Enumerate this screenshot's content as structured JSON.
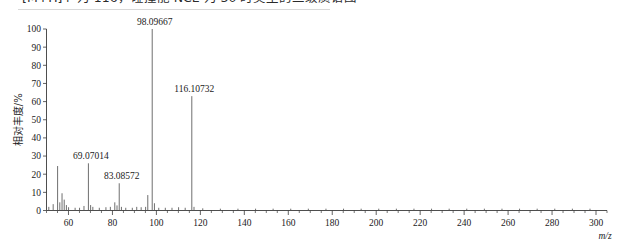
{
  "caption": {
    "text": "[M+H]+ 为 116，碰撞能 NCE 为 30 时类型的二级质谱图"
  },
  "chart_data": {
    "type": "bar",
    "title": "",
    "subtitle": "",
    "xlabel": "m/z",
    "ylabel": "相对丰度/%",
    "xlim": [
      50,
      305
    ],
    "ylim": [
      0,
      100
    ],
    "grid": false,
    "legend": "none",
    "x_ticks": [
      60,
      80,
      100,
      120,
      140,
      160,
      180,
      200,
      220,
      240,
      260,
      280,
      300
    ],
    "x_tick_labels": [
      "60",
      "80",
      "100",
      "120",
      "140",
      "160",
      "180",
      "200",
      "220",
      "240",
      "260",
      "280",
      "300"
    ],
    "x_minor_step": 5,
    "y_ticks": [
      0,
      10,
      20,
      30,
      40,
      50,
      60,
      70,
      80,
      90,
      100
    ],
    "y_tick_labels": [
      "0",
      "10",
      "20",
      "30",
      "40",
      "50",
      "60",
      "70",
      "80",
      "90",
      "100"
    ],
    "peaks": [
      {
        "mz": 51.05,
        "intensity": 2.0,
        "label": ""
      },
      {
        "mz": 53.04,
        "intensity": 3.5,
        "label": ""
      },
      {
        "mz": 55.05,
        "intensity": 24.5,
        "label": ""
      },
      {
        "mz": 56.05,
        "intensity": 4.5,
        "label": ""
      },
      {
        "mz": 57.07,
        "intensity": 9.5,
        "label": ""
      },
      {
        "mz": 58.06,
        "intensity": 6.0,
        "label": ""
      },
      {
        "mz": 59.05,
        "intensity": 3.0,
        "label": ""
      },
      {
        "mz": 60.04,
        "intensity": 1.8,
        "label": ""
      },
      {
        "mz": 63.02,
        "intensity": 1.5,
        "label": ""
      },
      {
        "mz": 65.04,
        "intensity": 1.5,
        "label": ""
      },
      {
        "mz": 67.05,
        "intensity": 2.5,
        "label": ""
      },
      {
        "mz": 69.07014,
        "intensity": 26.0,
        "label": "69.07014"
      },
      {
        "mz": 70.07,
        "intensity": 3.0,
        "label": ""
      },
      {
        "mz": 71.08,
        "intensity": 2.0,
        "label": ""
      },
      {
        "mz": 74.02,
        "intensity": 1.5,
        "label": ""
      },
      {
        "mz": 77.04,
        "intensity": 1.8,
        "label": ""
      },
      {
        "mz": 79.05,
        "intensity": 2.0,
        "label": ""
      },
      {
        "mz": 81.07,
        "intensity": 4.5,
        "label": ""
      },
      {
        "mz": 82.08,
        "intensity": 2.8,
        "label": ""
      },
      {
        "mz": 83.08572,
        "intensity": 15.0,
        "label": "83.08572"
      },
      {
        "mz": 84.09,
        "intensity": 2.0,
        "label": ""
      },
      {
        "mz": 86.06,
        "intensity": 1.5,
        "label": ""
      },
      {
        "mz": 89.04,
        "intensity": 1.5,
        "label": ""
      },
      {
        "mz": 91.05,
        "intensity": 2.0,
        "label": ""
      },
      {
        "mz": 93.07,
        "intensity": 1.8,
        "label": ""
      },
      {
        "mz": 95.09,
        "intensity": 2.0,
        "label": ""
      },
      {
        "mz": 96.08,
        "intensity": 8.5,
        "label": ""
      },
      {
        "mz": 98.09667,
        "intensity": 100.0,
        "label": "98.09667"
      },
      {
        "mz": 99.1,
        "intensity": 4.0,
        "label": ""
      },
      {
        "mz": 101.07,
        "intensity": 1.5,
        "label": ""
      },
      {
        "mz": 104.05,
        "intensity": 1.5,
        "label": ""
      },
      {
        "mz": 107.09,
        "intensity": 1.5,
        "label": ""
      },
      {
        "mz": 110.09,
        "intensity": 1.8,
        "label": ""
      },
      {
        "mz": 113.1,
        "intensity": 1.5,
        "label": ""
      },
      {
        "mz": 116.10732,
        "intensity": 63.0,
        "label": "116.10732"
      },
      {
        "mz": 117.11,
        "intensity": 2.0,
        "label": ""
      },
      {
        "mz": 121.09,
        "intensity": 1.2,
        "label": ""
      },
      {
        "mz": 129.1,
        "intensity": 1.0,
        "label": ""
      },
      {
        "mz": 137.1,
        "intensity": 1.0,
        "label": ""
      },
      {
        "mz": 145.12,
        "intensity": 1.0,
        "label": ""
      },
      {
        "mz": 153.1,
        "intensity": 1.0,
        "label": ""
      },
      {
        "mz": 161.12,
        "intensity": 1.0,
        "label": ""
      },
      {
        "mz": 169.12,
        "intensity": 1.0,
        "label": ""
      },
      {
        "mz": 177.14,
        "intensity": 1.0,
        "label": ""
      },
      {
        "mz": 185.14,
        "intensity": 1.0,
        "label": ""
      },
      {
        "mz": 193.15,
        "intensity": 1.0,
        "label": ""
      },
      {
        "mz": 201.16,
        "intensity": 1.0,
        "label": ""
      },
      {
        "mz": 209.17,
        "intensity": 1.0,
        "label": ""
      },
      {
        "mz": 217.18,
        "intensity": 1.0,
        "label": ""
      },
      {
        "mz": 225.18,
        "intensity": 1.0,
        "label": ""
      },
      {
        "mz": 233.19,
        "intensity": 1.0,
        "label": ""
      },
      {
        "mz": 241.2,
        "intensity": 1.0,
        "label": ""
      },
      {
        "mz": 249.21,
        "intensity": 1.0,
        "label": ""
      },
      {
        "mz": 257.22,
        "intensity": 1.0,
        "label": ""
      },
      {
        "mz": 265.22,
        "intensity": 1.0,
        "label": ""
      },
      {
        "mz": 273.23,
        "intensity": 1.0,
        "label": ""
      },
      {
        "mz": 281.24,
        "intensity": 1.0,
        "label": ""
      },
      {
        "mz": 289.25,
        "intensity": 1.0,
        "label": ""
      },
      {
        "mz": 297.26,
        "intensity": 1.0,
        "label": ""
      }
    ]
  },
  "colors": {
    "axis": "#3a3a3a",
    "peak": "#555555",
    "text": "#1a1a1a",
    "background": "#ffffff"
  }
}
